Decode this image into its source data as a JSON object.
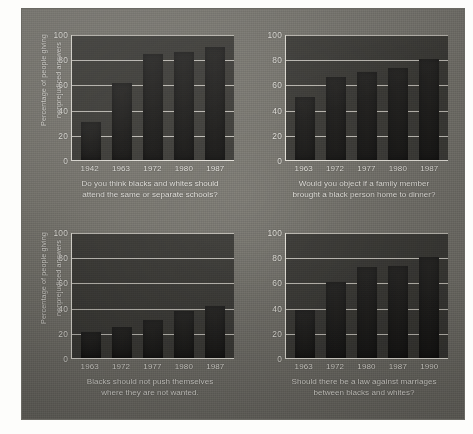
{
  "figure": {
    "background_color": "#77756e",
    "plot_color": "#3b3a36",
    "bar_color": "#1b1a18",
    "axis_color": "#e6e3db",
    "text_color": "#efede6"
  },
  "shared": {
    "ylabel_line1": "Percentage of people giving",
    "ylabel_line2": "nonprejudiced answers",
    "y_ticks": [
      "100",
      "80",
      "60",
      "40",
      "20",
      "0"
    ]
  },
  "chart_data": [
    {
      "type": "bar",
      "panel": "top-left",
      "title": "",
      "caption_line1": "Do you think blacks and whites should",
      "caption_line2": "attend the same or separate schools?",
      "xlabel": "",
      "ylabel": "Percentage of people giving nonprejudiced answers",
      "categories": [
        "1942",
        "1963",
        "1972",
        "1980",
        "1987"
      ],
      "values": [
        30,
        61,
        84,
        86,
        90
      ],
      "ylim": [
        0,
        100
      ],
      "yticks": [
        0,
        20,
        40,
        60,
        80,
        100
      ],
      "grid": true,
      "legend": "none"
    },
    {
      "type": "bar",
      "panel": "top-right",
      "title": "",
      "caption_line1": "Would you object if a family member",
      "caption_line2": "brought a black person home to dinner?",
      "xlabel": "",
      "ylabel": "",
      "categories": [
        "1963",
        "1972",
        "1977",
        "1980",
        "1987"
      ],
      "values": [
        50,
        66,
        70,
        73,
        80
      ],
      "ylim": [
        0,
        100
      ],
      "yticks": [
        0,
        20,
        40,
        60,
        80,
        100
      ],
      "grid": true,
      "legend": "none"
    },
    {
      "type": "bar",
      "panel": "bottom-left",
      "title": "",
      "caption_line1": "Blacks should not push themselves",
      "caption_line2": "where they are not wanted.",
      "xlabel": "",
      "ylabel": "Percentage of people giving nonprejudiced answers",
      "categories": [
        "1963",
        "1972",
        "1977",
        "1980",
        "1987"
      ],
      "values": [
        21,
        25,
        30,
        37,
        41
      ],
      "ylim": [
        0,
        100
      ],
      "yticks": [
        0,
        20,
        40,
        60,
        80,
        100
      ],
      "grid": true,
      "legend": "none"
    },
    {
      "type": "bar",
      "panel": "bottom-right",
      "title": "",
      "caption_line1": "Should there be a law against marriages",
      "caption_line2": "between blacks and whites?",
      "xlabel": "",
      "ylabel": "",
      "categories": [
        "1963",
        "1972",
        "1980",
        "1987",
        "1990"
      ],
      "values": [
        38,
        60,
        72,
        73,
        80
      ],
      "ylim": [
        0,
        100
      ],
      "yticks": [
        0,
        20,
        40,
        60,
        80,
        100
      ],
      "grid": true,
      "legend": "none"
    }
  ]
}
